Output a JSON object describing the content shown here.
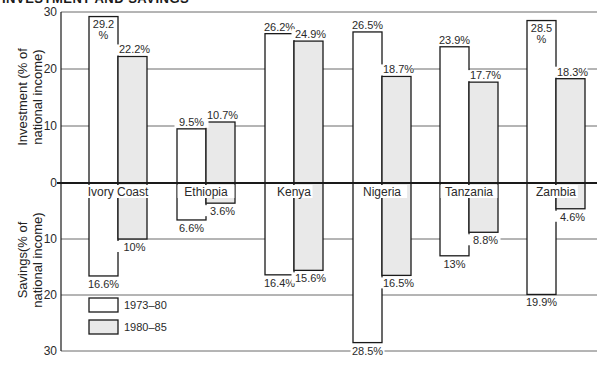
{
  "chart_data": {
    "type": "bar",
    "title": "INVESTMENT AND SAVINGS",
    "categories": [
      "Ivory Coast",
      "Ethiopia",
      "Kenya",
      "Nigeria",
      "Tanzania",
      "Zambia"
    ],
    "panels": [
      {
        "name": "Investment",
        "ylabel": "Investment (% of national income)",
        "direction": "up",
        "ylim": [
          0,
          30
        ],
        "ticks": [
          0,
          10,
          20,
          30
        ],
        "series": [
          {
            "name": "1973–80",
            "values": [
              29.2,
              9.5,
              26.2,
              26.5,
              23.9,
              28.5
            ],
            "labels": [
              "29.2 %",
              "9.5%",
              "26.2%",
              "26.5%",
              "23.9%",
              "28.5 %"
            ]
          },
          {
            "name": "1980–85",
            "values": [
              22.2,
              10.7,
              24.9,
              18.7,
              17.7,
              18.3
            ],
            "labels": [
              "22.2%",
              "10.7%",
              "24.9%",
              "18.7%",
              "17.7%",
              "18.3%"
            ]
          }
        ]
      },
      {
        "name": "Savings",
        "ylabel": "Savings (% of national income)",
        "direction": "down",
        "ylim": [
          0,
          30
        ],
        "ticks": [
          10,
          20,
          30
        ],
        "series": [
          {
            "name": "1973–80",
            "values": [
              16.6,
              6.6,
              16.4,
              28.5,
              13,
              19.9
            ],
            "labels": [
              "16.6%",
              "6.6%",
              "16.4%",
              "28.5%",
              "13%",
              "19.9%"
            ]
          },
          {
            "name": "1980–85",
            "values": [
              10,
              3.6,
              15.6,
              16.5,
              8.8,
              4.6
            ],
            "labels": [
              "10%",
              "3.6%",
              "15.6%",
              "16.5%",
              "8.8%",
              "4.6%"
            ]
          }
        ]
      }
    ],
    "legend": [
      {
        "label": "1973–80",
        "color": "#ffffff"
      },
      {
        "label": "1980–85",
        "color": "#e9e9e9"
      }
    ],
    "legend_position": "lower-left",
    "grid": true
  },
  "text": {
    "title": "INVESTMENT AND SAVINGS",
    "ylabel_top_line1": "Investment (% of",
    "ylabel_top_line2": "national income)",
    "ylabel_bottom_line1": "Savings(% of",
    "ylabel_bottom_line2": "national income)"
  },
  "colors": {
    "series_1973_80": "#ffffff",
    "series_1980_85": "#e9e9e9",
    "axis": "#1a1a1a",
    "grid": "#6a6a6a"
  }
}
